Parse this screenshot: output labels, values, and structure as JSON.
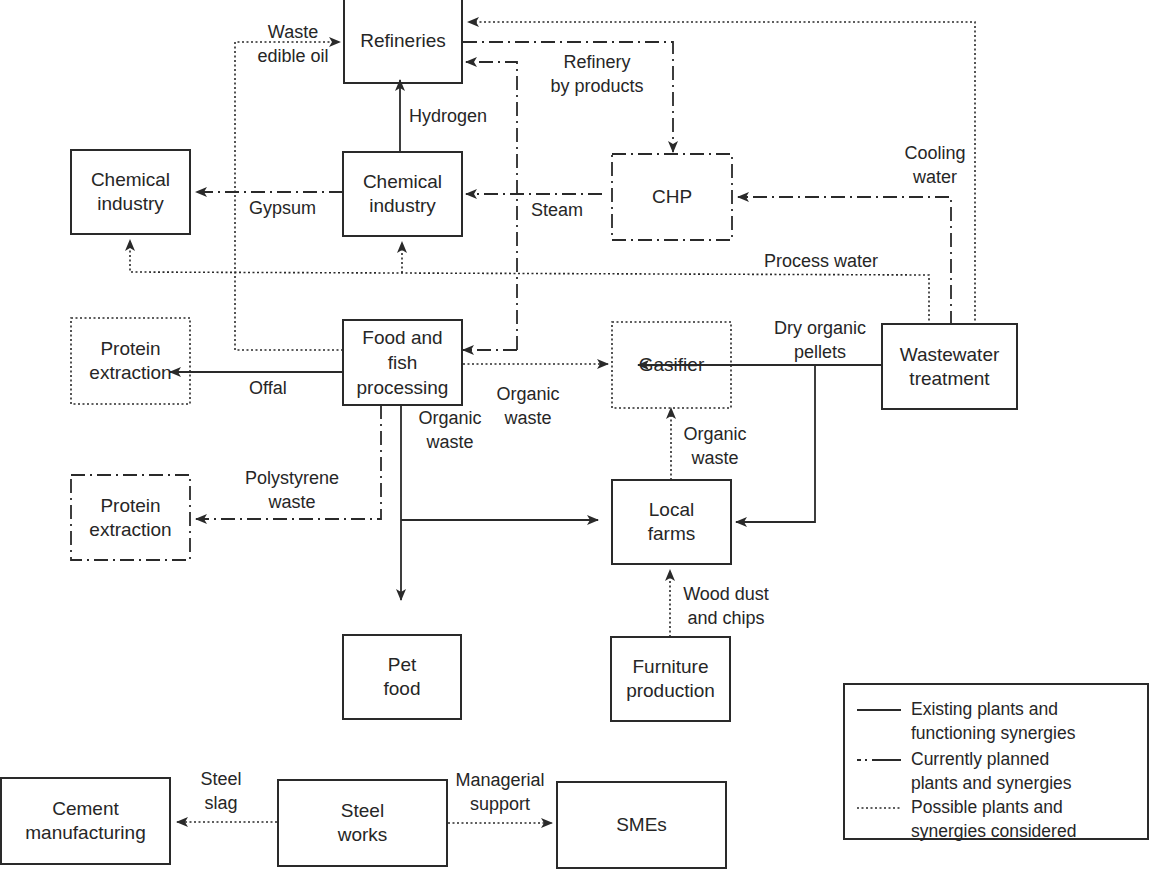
{
  "diagram": {
    "type": "industrial symbiosis flow diagram",
    "line_styles": {
      "existing": "solid",
      "planned": "dash-dot",
      "possible": "dotted"
    },
    "colors": {
      "stroke": "#2a2a2a",
      "text": "#262626",
      "background": "#ffffff"
    }
  },
  "nodes": {
    "refineries": {
      "label": "Refineries",
      "status": "existing"
    },
    "chemical_industry_left": {
      "label": "Chemical industry",
      "line1": "Chemical",
      "line2": "industry",
      "status": "existing"
    },
    "chemical_industry_center": {
      "label": "Chemical industry",
      "line1": "Chemical",
      "line2": "industry",
      "status": "existing"
    },
    "chp": {
      "label": "CHP",
      "status": "planned"
    },
    "protein_extraction_dotted": {
      "label": "Protein extraction",
      "line1": "Protein",
      "line2": "extraction",
      "status": "possible"
    },
    "food_fish_processing": {
      "label": "Food and fish processing",
      "line1": "Food and",
      "line2": "fish",
      "line3": "processing",
      "status": "existing"
    },
    "gasifier": {
      "label": "Gasifier",
      "status": "possible"
    },
    "wastewater_treatment": {
      "label": "Wastewater treatment",
      "line1": "Wastewater",
      "line2": "treatment",
      "status": "existing"
    },
    "protein_extraction_dashdot": {
      "label": "Protein extraction",
      "line1": "Protein",
      "line2": "extraction",
      "status": "planned"
    },
    "local_farms": {
      "label": "Local farms",
      "line1": "Local",
      "line2": "farms",
      "status": "existing"
    },
    "pet_food": {
      "label": "Pet food",
      "line1": "Pet",
      "line2": "food",
      "status": "existing"
    },
    "furniture_production": {
      "label": "Furniture production",
      "line1": "Furniture",
      "line2": "production",
      "status": "existing"
    },
    "cement_manufacturing": {
      "label": "Cement manufacturing",
      "line1": "Cement",
      "line2": "manufacturing",
      "status": "existing"
    },
    "steel_works": {
      "label": "Steel works",
      "line1": "Steel",
      "line2": "works",
      "status": "existing"
    },
    "smes": {
      "label": "SMEs",
      "status": "existing"
    }
  },
  "flows": {
    "waste_edible_oil": {
      "line1": "Waste",
      "line2": "edible oil",
      "from": "food_fish_processing",
      "to": "refineries",
      "style": "possible"
    },
    "refinery_by_products": {
      "line1": "Refinery",
      "line2": "by products",
      "from": "refineries",
      "to": "chp",
      "style": "planned"
    },
    "hydrogen": {
      "label": "Hydrogen",
      "from": "chemical_industry_center",
      "to": "refineries",
      "style": "existing"
    },
    "gypsum": {
      "label": "Gypsum",
      "from": "chemical_industry_center",
      "to": "chemical_industry_left",
      "style": "planned"
    },
    "steam": {
      "label": "Steam",
      "from": "chp",
      "to": "chemical_industry_center",
      "style": "planned"
    },
    "cooling_water": {
      "line1": "Cooling",
      "line2": "water",
      "from": "wastewater_treatment",
      "to": "chp",
      "style": "planned"
    },
    "process_water": {
      "label": "Process water",
      "from": "wastewater_treatment",
      "to": "chemical_industry_left, chemical_industry_center",
      "style": "possible"
    },
    "offal": {
      "label": "Offal",
      "from": "food_fish_processing",
      "to": "protein_extraction_dotted",
      "style": "existing"
    },
    "organic_waste_gasifier": {
      "line1": "Organic",
      "line2": "waste",
      "from": "food_fish_processing",
      "to": "gasifier",
      "style": "possible"
    },
    "dry_organic_pellets": {
      "line1": "Dry organic",
      "line2": "pellets",
      "from": "wastewater_treatment",
      "to": "gasifier, local_farms",
      "style": "existing"
    },
    "organic_waste_farms_to_gasifier": {
      "line1": "Organic",
      "line2": "waste",
      "from": "local_farms",
      "to": "gasifier",
      "style": "possible"
    },
    "polystyrene_waste": {
      "line1": "Polystyrene",
      "line2": "waste",
      "from": "food_fish_processing",
      "to": "protein_extraction_dashdot",
      "style": "planned"
    },
    "organic_waste_farms": {
      "line1": "Organic",
      "line2": "waste",
      "from": "food_fish_processing",
      "to": "local_farms, pet_food",
      "style": "existing"
    },
    "wood_dust_chips": {
      "line1": "Wood dust",
      "line2": "and chips",
      "from": "furniture_production",
      "to": "local_farms",
      "style": "possible"
    },
    "steel_slag": {
      "line1": "Steel",
      "line2": "slag",
      "from": "steel_works",
      "to": "cement_manufacturing",
      "style": "possible"
    },
    "managerial_support": {
      "line1": "Managerial",
      "line2": "support",
      "from": "steel_works",
      "to": "smes",
      "style": "possible"
    },
    "wastewater_to_refineries": {
      "from": "wastewater_treatment",
      "to": "refineries",
      "style": "possible"
    },
    "refineries_to_food_processing": {
      "from": "refineries",
      "to": "food_fish_processing",
      "style": "planned"
    }
  },
  "legend": {
    "items": [
      {
        "style": "solid",
        "line1": "Existing plants and",
        "line2": "functioning synergies"
      },
      {
        "style": "dash-dot",
        "line1": "Currently planned",
        "line2": "plants and synergies"
      },
      {
        "style": "dotted",
        "line1": "Possible plants and",
        "line2": "synergies considered"
      }
    ]
  }
}
